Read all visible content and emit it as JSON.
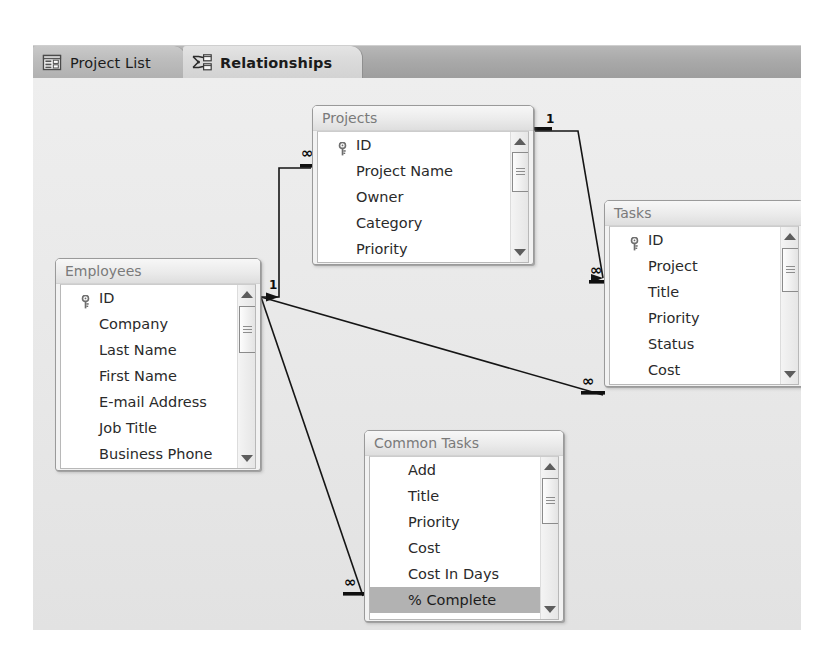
{
  "window": {
    "title": "Relationships",
    "background_color": "#e7e7e7",
    "tabstrip_color": "#a9a9a9"
  },
  "tabs": [
    {
      "id": "project-list",
      "label": "Project List",
      "icon": "project-list-icon",
      "active": false
    },
    {
      "id": "relationships",
      "label": "Relationships",
      "icon": "relationships-icon",
      "active": true
    }
  ],
  "tables": [
    {
      "id": "projects",
      "title": "Projects",
      "fields": [
        {
          "name": "ID",
          "key": true
        },
        {
          "name": "Project Name",
          "key": false
        },
        {
          "name": "Owner",
          "key": false
        },
        {
          "name": "Category",
          "key": false
        },
        {
          "name": "Priority",
          "key": false
        }
      ],
      "selected_field": null
    },
    {
      "id": "tasks",
      "title": "Tasks",
      "fields": [
        {
          "name": "ID",
          "key": true
        },
        {
          "name": "Project",
          "key": false
        },
        {
          "name": "Title",
          "key": false
        },
        {
          "name": "Priority",
          "key": false
        },
        {
          "name": "Status",
          "key": false
        },
        {
          "name": "Cost",
          "key": false
        }
      ],
      "selected_field": null
    },
    {
      "id": "employees",
      "title": "Employees",
      "fields": [
        {
          "name": "ID",
          "key": true
        },
        {
          "name": "Company",
          "key": false
        },
        {
          "name": "Last Name",
          "key": false
        },
        {
          "name": "First Name",
          "key": false
        },
        {
          "name": "E-mail Address",
          "key": false
        },
        {
          "name": "Job Title",
          "key": false
        },
        {
          "name": "Business Phone",
          "key": false
        }
      ],
      "selected_field": null
    },
    {
      "id": "common-tasks",
      "title": "Common Tasks",
      "fields": [
        {
          "name": "Add",
          "key": false
        },
        {
          "name": "Title",
          "key": false
        },
        {
          "name": "Priority",
          "key": false
        },
        {
          "name": "Cost",
          "key": false
        },
        {
          "name": "Cost In Days",
          "key": false
        },
        {
          "name": "% Complete",
          "key": false
        }
      ],
      "selected_field": "% Complete"
    }
  ],
  "relationships": [
    {
      "id": "projects-tasks",
      "from": "Projects",
      "to": "Tasks",
      "from_cardinality": "1",
      "to_cardinality": "∞"
    },
    {
      "id": "employees-projects",
      "from": "Employees",
      "to": "Projects",
      "from_cardinality": "1",
      "to_cardinality": "∞"
    },
    {
      "id": "employees-tasks",
      "from": "Employees",
      "to": "Tasks",
      "from_cardinality": "1",
      "to_cardinality": "∞"
    },
    {
      "id": "employees-common-tasks",
      "from": "Employees",
      "to": "Common Tasks",
      "from_cardinality": "1",
      "to_cardinality": "∞"
    }
  ],
  "cardinality_markers": {
    "one": "1",
    "many": "∞"
  }
}
